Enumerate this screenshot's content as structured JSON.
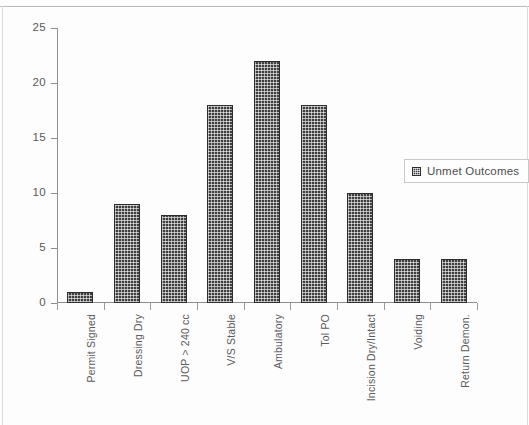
{
  "chart_data": {
    "type": "bar",
    "title": "",
    "xlabel": "",
    "ylabel": "",
    "categories": [
      "Permit Signed",
      "Dressing Dry",
      "UOP > 240 cc",
      "V/S Stable",
      "Ambulatory",
      "Tol PO",
      "Incision Dry/Intact",
      "Voiding",
      "Return Demon."
    ],
    "values": [
      1,
      9,
      8,
      18,
      22,
      18,
      10,
      4,
      4
    ],
    "series": [
      {
        "name": "Unmet Outcomes",
        "values": [
          1,
          9,
          8,
          18,
          22,
          18,
          10,
          4,
          4
        ]
      }
    ],
    "ylim": [
      0,
      25
    ],
    "yticks": [
      0,
      5,
      10,
      15,
      20,
      25
    ],
    "ytick_labels": [
      "0",
      "5",
      "10",
      "15",
      "20",
      "25"
    ],
    "grid": false,
    "legend_position": "right-middle",
    "bar_color": "#403f40",
    "bar_pattern": "checkerboard-dot"
  },
  "legend": {
    "entries": [
      {
        "label": "Unmet Outcomes",
        "swatch": "checkered-swatch-icon"
      }
    ]
  },
  "axes": {
    "y_tick_labels": [
      "25",
      "20",
      "15",
      "10",
      "5",
      "0"
    ],
    "x_tick_labels": [
      "Permit Signed",
      "Dressing Dry",
      "UOP > 240 cc",
      "V/S Stable",
      "Ambulatory",
      "Tol PO",
      "Incision Dry/Intact",
      "Voiding",
      "Return Demon."
    ]
  }
}
